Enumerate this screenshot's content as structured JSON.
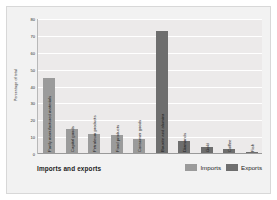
{
  "chart_data": {
    "type": "bar",
    "title": "",
    "xlabel": "Imports and exports",
    "ylabel": "Percentage of total",
    "ylim": [
      0,
      80
    ],
    "ytick_labels": [
      "80",
      "70",
      "60",
      "50",
      "40",
      "30",
      "20",
      "10",
      "0"
    ],
    "ytick_values": [
      80,
      70,
      60,
      50,
      40,
      30,
      20,
      10,
      0
    ],
    "grid": true,
    "legend_position": "bottom-right",
    "categories": [
      "Partly manufactured materials",
      "Capital goods",
      "Petroleum products",
      "Food products",
      "Consumer goods",
      "Bauxite and alumina",
      "Diamonds",
      "Gold",
      "Coffee",
      "Fish"
    ],
    "bars": [
      {
        "label": "Partly manufactured materials",
        "value": 45,
        "series": "Imports"
      },
      {
        "label": "Capital goods",
        "value": 15,
        "series": "Imports"
      },
      {
        "label": "Petroleum products",
        "value": 12,
        "series": "Imports"
      },
      {
        "label": "Food products",
        "value": 11,
        "series": "Imports"
      },
      {
        "label": "Consumer goods",
        "value": 9,
        "series": "Imports"
      },
      {
        "label": "Bauxite and alumina",
        "value": 73,
        "series": "Exports"
      },
      {
        "label": "Diamonds",
        "value": 8,
        "series": "Exports"
      },
      {
        "label": "Gold",
        "value": 4,
        "series": "Exports"
      },
      {
        "label": "Coffee",
        "value": 3,
        "series": "Exports"
      },
      {
        "label": "Fish",
        "value": 1,
        "series": "Exports"
      }
    ],
    "series": [
      {
        "name": "Imports",
        "color": "#9b9b9b"
      },
      {
        "name": "Exports",
        "color": "#6e6e6e"
      }
    ]
  },
  "legend": {
    "items": [
      {
        "label": "Imports",
        "key": "imports"
      },
      {
        "label": "Exports",
        "key": "exports"
      }
    ]
  },
  "colors": {
    "imports": "#9b9b9b",
    "exports": "#6e6e6e",
    "plot_background": "#eceaea",
    "card_background": "#f2f2f2",
    "gridline": "#ffffff"
  }
}
